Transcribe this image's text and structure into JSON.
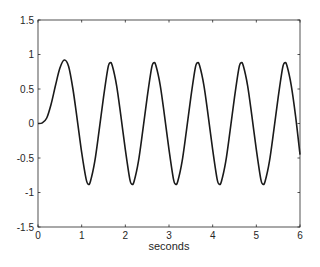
{
  "chart_data": {
    "type": "line",
    "title": "",
    "xlabel": "seconds",
    "ylabel": "",
    "xlim": [
      0,
      6
    ],
    "ylim": [
      -1.5,
      1.5
    ],
    "xticks": [
      0,
      1,
      2,
      3,
      4,
      5,
      6
    ],
    "xtick_labels": [
      "0",
      "1",
      "2",
      "3",
      "4",
      "5",
      "6"
    ],
    "yticks": [
      1.5,
      1,
      0.5,
      0,
      -0.5,
      -1,
      -1.5
    ],
    "ytick_labels": [
      "1.5",
      "1",
      "0.5",
      "0",
      "-0.5",
      "-1",
      "-1.5"
    ],
    "grid": false,
    "legend": null,
    "series": [
      {
        "name": "response",
        "color": "#1a1a1a",
        "x": [
          0,
          0.1,
          0.2,
          0.3,
          0.4,
          0.5,
          0.6,
          0.7,
          0.8,
          0.9,
          1.0,
          1.1,
          1.15,
          1.2,
          1.3,
          1.4,
          1.5,
          1.6,
          1.65,
          1.7,
          1.8,
          1.9,
          2.0,
          2.1,
          2.15,
          2.2,
          2.3,
          2.4,
          2.5,
          2.6,
          2.65,
          2.7,
          2.8,
          2.9,
          3.0,
          3.1,
          3.15,
          3.2,
          3.3,
          3.4,
          3.5,
          3.6,
          3.65,
          3.7,
          3.8,
          3.9,
          4.0,
          4.1,
          4.15,
          4.2,
          4.3,
          4.4,
          4.5,
          4.6,
          4.65,
          4.7,
          4.8,
          4.9,
          5.0,
          5.1,
          5.15,
          5.2,
          5.3,
          5.4,
          5.5,
          5.6,
          5.65,
          5.7,
          5.8,
          5.9,
          6.0
        ],
        "y": [
          0,
          0.01,
          0.08,
          0.28,
          0.55,
          0.8,
          0.92,
          0.83,
          0.5,
          0.05,
          -0.42,
          -0.8,
          -0.88,
          -0.84,
          -0.55,
          -0.1,
          0.38,
          0.8,
          0.88,
          0.84,
          0.55,
          0.1,
          -0.38,
          -0.8,
          -0.88,
          -0.84,
          -0.55,
          -0.1,
          0.38,
          0.8,
          0.88,
          0.84,
          0.55,
          0.1,
          -0.38,
          -0.8,
          -0.88,
          -0.84,
          -0.55,
          -0.1,
          0.38,
          0.8,
          0.88,
          0.84,
          0.55,
          0.1,
          -0.38,
          -0.8,
          -0.88,
          -0.84,
          -0.55,
          -0.1,
          0.38,
          0.8,
          0.88,
          0.84,
          0.55,
          0.1,
          -0.38,
          -0.8,
          -0.88,
          -0.84,
          -0.55,
          -0.1,
          0.38,
          0.8,
          0.88,
          0.84,
          0.55,
          0.1,
          -0.45
        ]
      }
    ]
  },
  "colors": {
    "background": "#ffffff",
    "axes": "#262626",
    "line": "#1a1a1a"
  }
}
